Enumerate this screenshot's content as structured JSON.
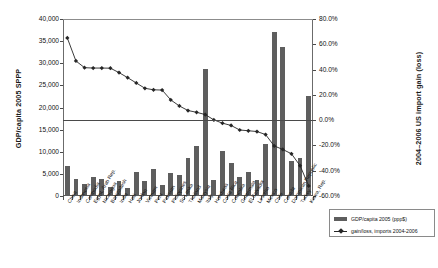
{
  "chart_data": {
    "type": "bar",
    "title": "",
    "xlabel": "",
    "ylabel": "GDP/capita 2005 SPPP",
    "y2label": "2004–2006 US import gain (loss)",
    "ylim": [
      0,
      40000
    ],
    "y2lim": [
      -60,
      80
    ],
    "grid": false,
    "legend_position": "bottom-right",
    "y_ticks": [
      "0",
      "5,000",
      "10,000",
      "15,000",
      "20,000",
      "25,000",
      "30,000",
      "35,000",
      "40,000"
    ],
    "y2_ticks": [
      "-60.0%",
      "-40.0%",
      "-20.0%",
      "0.0%",
      "20.0%",
      "40.0%",
      "60.0%",
      "80.0%"
    ],
    "reference_line": {
      "axis": "y2",
      "value": 0.0,
      "label": "0.0%"
    },
    "categories": [
      "China",
      "Indonesia",
      "Cambodia",
      "Egypt, Arab Rep.",
      "Nicaragua",
      "Bangladesh",
      "India",
      "Haiti",
      "Jordan",
      "Vietnam",
      "Peru",
      "Pakistan",
      "Philippines",
      "Sri Lanka",
      "Thailand",
      "Malaysia",
      "Italy",
      "Honduras",
      "Costa Rica",
      "Colombia",
      "Guatemala",
      "El Salvador",
      "Lesotho",
      "Mexico",
      "Chile",
      "Canada",
      "Dominican Republic",
      "Turkey",
      "Korea, Rep."
    ],
    "series": [
      {
        "name": "GDP/capita 2005 (ppp$)",
        "type": "bar",
        "axis": "left",
        "color": "#5e5e5e",
        "values": [
          6760,
          3840,
          2720,
          4340,
          3810,
          2090,
          3450,
          1800,
          5530,
          3290,
          6040,
          2540,
          5190,
          4840,
          8680,
          11200,
          28700,
          3700,
          10200,
          7350,
          4400,
          5320,
          3520,
          11700,
          37000,
          33700,
          8000,
          8500,
          22600
        ]
      },
      {
        "name": "gain/loss, imports 2004-2006",
        "type": "line",
        "axis": "right",
        "color": "#262626",
        "marker": "diamond",
        "values": [
          65.0,
          46.8,
          41.5,
          41.2,
          41.2,
          41.1,
          37.6,
          33.6,
          29.4,
          25.2,
          24.0,
          23.8,
          16.0,
          11.2,
          7.6,
          6.2,
          4.4,
          0.2,
          -2.4,
          -4.2,
          -7.8,
          -8.4,
          -9.0,
          -11.4,
          -20.4,
          -23.2,
          -26.6,
          -36.0,
          -52.0
        ]
      }
    ]
  },
  "legend": {
    "items": [
      {
        "label": "GDP/capita 2005 (ppp$)",
        "marker": "bar"
      },
      {
        "label": "gain/loss, imports 2004-2006",
        "marker": "line"
      }
    ]
  }
}
